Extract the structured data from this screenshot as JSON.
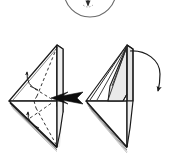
{
  "diagram": {
    "caption": "Two origami steps: push-in fold on left model, fold-down flap on right model",
    "background_color": "#ffffff",
    "ink_color": "#1a1a1a",
    "paper_fill": "#ffffff",
    "shaded_fill": "#e9e9e9",
    "shaded_fill_dark": "#dcdcdc",
    "arrow_fill_solid": "#0d0d0d",
    "crease_style": "dashed",
    "line_width": "1.1"
  },
  "elements": {
    "top_circle": {
      "name": "partial-circle-detail",
      "label": "detail circle (cropped)",
      "center_x": 90,
      "center_y": -9,
      "radius": 26,
      "stroke": "#555555"
    },
    "top_marker": {
      "name": "small-arrowhead-marker",
      "label": "small arrowhead inside detail circle",
      "x": 88,
      "y": 4
    },
    "left_model": {
      "name": "origami-model-left",
      "label": "Left origami model — kite/diamond form viewed from side",
      "apex_x": 57,
      "apex_y": 45,
      "bottom_x": 57,
      "bottom_y": 147,
      "left_x": 9,
      "left_y": 101
    },
    "right_model": {
      "name": "origami-model-right",
      "label": "Right origami model — result after push-in fold",
      "apex_x": 127,
      "apex_y": 45,
      "bottom_x": 127,
      "bottom_y": 147,
      "left_x": 86,
      "left_y": 101
    },
    "solid_arrow": {
      "name": "push-arrow-solid-black",
      "label": "solid black push arrow pointing left into model",
      "direction": "left",
      "tail_x": 82,
      "tail_y": 98,
      "tip_x": 51,
      "tip_y": 98
    },
    "curved_arrow_upper_left": {
      "name": "fold-arrow-upper-left",
      "label": "thin curved fold arrow, upper left flap",
      "direction": "up-left"
    },
    "curved_arrow_lower_left": {
      "name": "fold-arrow-lower-left",
      "label": "thin curved fold arrow, lower left flap",
      "direction": "up-left"
    },
    "curved_arrow_right": {
      "name": "fold-down-arrow-right",
      "label": "large curved arrow sweeping from apex right and down",
      "direction": "clockwise-down",
      "start_x": 133,
      "start_y": 52,
      "end_x": 159,
      "end_y": 92
    },
    "creases_left": {
      "name": "crease-lines-left-model",
      "label": "dashed hidden/crease lines on left model",
      "count": 4
    },
    "layer_edges_left": {
      "name": "paper-layer-edges-left",
      "label": "stacked paper layer edges along lower-left edge",
      "count": 3
    },
    "layer_edges_right": {
      "name": "paper-layer-edges-right",
      "label": "stacked paper layer edges along lower-left edge",
      "count": 4
    }
  }
}
